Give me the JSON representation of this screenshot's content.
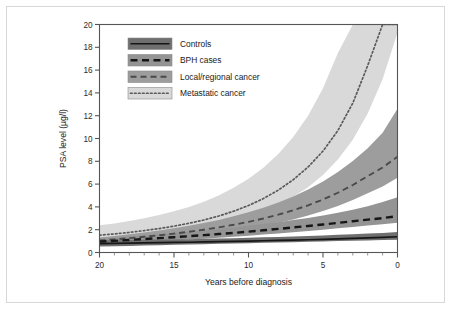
{
  "chart_data": {
    "type": "line",
    "title": "",
    "xlabel": "Years before diagnosis",
    "ylabel": "PSA level (µg/l)",
    "xlim": [
      20,
      0
    ],
    "ylim": [
      0,
      20
    ],
    "x_ticks": [
      "20",
      "15",
      "10",
      "5",
      "0"
    ],
    "x_tick_values": [
      20,
      15,
      10,
      5,
      0
    ],
    "x_minor_step": 1,
    "y_ticks": [
      "0",
      "2",
      "4",
      "6",
      "8",
      "10",
      "12",
      "14",
      "16",
      "18",
      "20"
    ],
    "y_tick_values": [
      0,
      2,
      4,
      6,
      8,
      10,
      12,
      14,
      16,
      18,
      20
    ],
    "grid": false,
    "legend_position": "top-left",
    "x": [
      20,
      19,
      18,
      17,
      16,
      15,
      14,
      13,
      12,
      11,
      10,
      9,
      8,
      7,
      6,
      5,
      4,
      3,
      2,
      1,
      0
    ],
    "series": [
      {
        "name": "Controls",
        "line_style": "solid",
        "line_color": "#161616",
        "band_color": "#6f6f6f",
        "values": [
          0.78,
          0.8,
          0.82,
          0.84,
          0.86,
          0.88,
          0.9,
          0.93,
          0.95,
          0.98,
          1.0,
          1.03,
          1.06,
          1.09,
          1.12,
          1.16,
          1.2,
          1.24,
          1.28,
          1.33,
          1.38
        ],
        "band_lower": [
          0.52,
          0.55,
          0.58,
          0.61,
          0.64,
          0.67,
          0.7,
          0.73,
          0.76,
          0.79,
          0.82,
          0.85,
          0.88,
          0.91,
          0.94,
          0.97,
          1.0,
          1.03,
          1.06,
          1.09,
          1.12
        ],
        "band_upper": [
          1.05,
          1.07,
          1.09,
          1.11,
          1.13,
          1.15,
          1.17,
          1.2,
          1.23,
          1.26,
          1.29,
          1.33,
          1.37,
          1.41,
          1.45,
          1.5,
          1.55,
          1.6,
          1.66,
          1.72,
          1.8
        ]
      },
      {
        "name": "BPH cases",
        "line_style": "dashed",
        "line_color": "#161616",
        "band_color": "#949494",
        "values": [
          0.95,
          1.02,
          1.1,
          1.18,
          1.26,
          1.34,
          1.43,
          1.52,
          1.62,
          1.72,
          1.83,
          1.95,
          2.07,
          2.2,
          2.33,
          2.46,
          2.6,
          2.74,
          2.88,
          3.02,
          3.18
        ],
        "band_lower": [
          0.72,
          0.78,
          0.85,
          0.92,
          0.99,
          1.06,
          1.13,
          1.21,
          1.29,
          1.38,
          1.47,
          1.57,
          1.67,
          1.78,
          1.89,
          2.0,
          2.12,
          2.24,
          2.36,
          2.48,
          2.6
        ],
        "band_upper": [
          1.2,
          1.3,
          1.4,
          1.5,
          1.6,
          1.71,
          1.82,
          1.94,
          2.07,
          2.2,
          2.34,
          2.5,
          2.66,
          2.84,
          3.03,
          3.24,
          3.48,
          3.75,
          4.06,
          4.42,
          4.85
        ]
      },
      {
        "name": "Local/regional cancer",
        "line_style": "long-dash",
        "line_color": "#4a4a4a",
        "band_color": "#9d9d9d",
        "values": [
          1.05,
          1.15,
          1.26,
          1.38,
          1.51,
          1.66,
          1.82,
          2.0,
          2.2,
          2.43,
          2.69,
          2.98,
          3.32,
          3.7,
          4.14,
          4.65,
          5.24,
          5.92,
          6.7,
          7.45,
          8.4
        ],
        "band_lower": [
          0.82,
          0.9,
          0.99,
          1.08,
          1.18,
          1.3,
          1.43,
          1.57,
          1.73,
          1.91,
          2.11,
          2.34,
          2.6,
          2.9,
          3.24,
          3.63,
          4.08,
          4.6,
          5.2,
          5.8,
          6.55
        ],
        "band_upper": [
          1.32,
          1.45,
          1.6,
          1.76,
          1.94,
          2.13,
          2.35,
          2.59,
          2.86,
          3.17,
          3.52,
          3.92,
          4.38,
          4.91,
          5.52,
          6.23,
          7.06,
          8.03,
          9.15,
          10.5,
          12.6
        ]
      },
      {
        "name": "Metastatic cancer",
        "line_style": "dotted",
        "line_color": "#5a5a5a",
        "band_color": "#d9d9d9",
        "values": [
          1.52,
          1.63,
          1.76,
          1.92,
          2.1,
          2.31,
          2.56,
          2.85,
          3.2,
          3.62,
          4.12,
          4.73,
          5.47,
          6.38,
          7.5,
          8.9,
          10.7,
          13.1,
          16.4,
          20.0,
          26.0
        ],
        "band_lower": [
          1.18,
          1.27,
          1.37,
          1.49,
          1.63,
          1.79,
          1.98,
          2.2,
          2.47,
          2.79,
          3.17,
          3.63,
          4.19,
          4.88,
          5.73,
          6.8,
          8.15,
          9.9,
          12.2,
          15.2,
          19.3
        ],
        "band_upper": [
          2.38,
          2.55,
          2.76,
          3.0,
          3.28,
          3.61,
          4.0,
          4.46,
          5.01,
          5.67,
          6.47,
          7.44,
          8.64,
          10.13,
          12.0,
          14.4,
          17.5,
          20.0,
          20.0,
          20.0,
          20.0
        ]
      }
    ]
  },
  "legend": {
    "items": [
      {
        "label": "Controls"
      },
      {
        "label": "BPH cases"
      },
      {
        "label": "Local/regional cancer"
      },
      {
        "label": "Metastatic cancer"
      }
    ]
  },
  "axes": {
    "y_title": "PSA level (µg/l)",
    "x_title": "Years before diagnosis"
  }
}
